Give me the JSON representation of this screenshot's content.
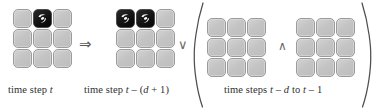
{
  "figure": {
    "type": "logic-formula-grid-diagram",
    "operators": {
      "implies": "⇒",
      "or": "∨",
      "and": "∧",
      "paren_open": "(",
      "paren_close": ")"
    },
    "colors": {
      "cell_fill": "#c8c8c8",
      "cell_border": "#9b9b9b",
      "cell_occupied_fill": "#101010",
      "cell_occupied_mark": "#ffffff",
      "text": "#2f2f2f",
      "operator": "#5a5a5a",
      "background": "#ffffff"
    },
    "panels": [
      {
        "id": "panel-antecedent",
        "caption": "time step t",
        "caption_parts": [
          {
            "text": "time step ",
            "italic": false
          },
          {
            "text": "t",
            "italic": true
          }
        ],
        "grid": {
          "rows": 3,
          "cols": 3,
          "cells": [
            [
              "empty",
              "occupied",
              "empty"
            ],
            [
              "empty",
              "empty",
              "empty"
            ],
            [
              "empty",
              "empty",
              "empty"
            ]
          ]
        }
      },
      {
        "id": "panel-consequent-first",
        "caption": "time step t − (d + 1)",
        "caption_parts": [
          {
            "text": "time step ",
            "italic": false
          },
          {
            "text": "t",
            "italic": true
          },
          {
            "text": " – (",
            "italic": false
          },
          {
            "text": "d",
            "italic": true
          },
          {
            "text": " + 1)",
            "italic": false
          }
        ],
        "grid": {
          "rows": 3,
          "cols": 3,
          "cells": [
            [
              "occupied",
              "occupied",
              "empty"
            ],
            [
              "empty",
              "empty",
              "empty"
            ],
            [
              "empty",
              "empty",
              "empty"
            ]
          ]
        }
      },
      {
        "id": "panel-history-left",
        "caption": "",
        "grid": {
          "rows": 3,
          "cols": 3,
          "cells": [
            [
              "empty",
              "empty",
              "empty"
            ],
            [
              "empty",
              "empty",
              "empty"
            ],
            [
              "empty",
              "empty",
              "empty"
            ]
          ]
        }
      },
      {
        "id": "panel-history-right",
        "caption": "",
        "grid": {
          "rows": 3,
          "cols": 3,
          "cells": [
            [
              "empty",
              "empty",
              "empty"
            ],
            [
              "empty",
              "empty",
              "empty"
            ],
            [
              "empty",
              "empty",
              "empty"
            ]
          ]
        }
      }
    ],
    "group_caption": "time steps t − d to t − 1",
    "group_caption_parts": [
      {
        "text": "time steps ",
        "italic": false
      },
      {
        "text": "t",
        "italic": true
      },
      {
        "text": " – ",
        "italic": false
      },
      {
        "text": "d",
        "italic": true
      },
      {
        "text": " to ",
        "italic": false
      },
      {
        "text": "t",
        "italic": true
      },
      {
        "text": " – 1",
        "italic": false
      }
    ]
  }
}
